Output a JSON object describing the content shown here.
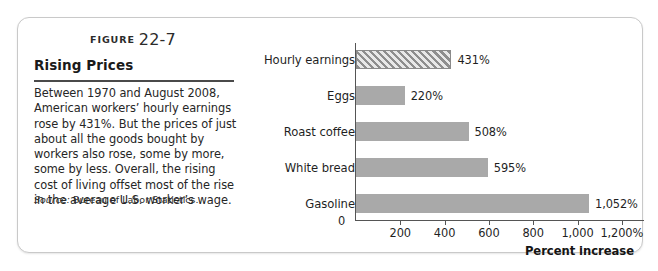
{
  "figure": {
    "label_word": "FIGURE",
    "number": "22-7",
    "title": "Rising Prices",
    "body": "Between 1970 and August 2008, American workers’ hourly earnings rose by 431%. But the prices of just about all the goods bought by workers also rose, some by more, some by less. Overall, the rising cost of living offset most of the rise in the average U.S. worker’s wage.",
    "source_word": "Source:",
    "source_text": " Bureau of Labor Statistics."
  },
  "colors": {
    "bar_fill": "#a9a9a9",
    "bar_hatch_stroke": "#8e8e8e",
    "axis": "#555555",
    "card_border": "#c9c9c9",
    "rule": "#4a4a4a"
  },
  "chart_data": {
    "type": "bar",
    "orientation": "horizontal",
    "title": "Rising Prices",
    "xlabel": "Percent increase",
    "ylabel": "",
    "categories": [
      "Hourly earnings",
      "Eggs",
      "Roast coffee",
      "White bread",
      "Gasoline"
    ],
    "values": [
      431,
      220,
      508,
      595,
      1052
    ],
    "value_labels": [
      "431%",
      "220%",
      "508%",
      "595%",
      "1,052%"
    ],
    "bar_styles": [
      "hatched",
      "solid",
      "solid",
      "solid",
      "solid"
    ],
    "xlim": [
      0,
      1300
    ],
    "xticks": [
      0,
      200,
      400,
      600,
      800,
      1000,
      1200
    ],
    "xtick_labels": [
      "0",
      "200",
      "400",
      "600",
      "800",
      "1,000",
      "1,200%"
    ],
    "grid": false,
    "legend": false
  }
}
